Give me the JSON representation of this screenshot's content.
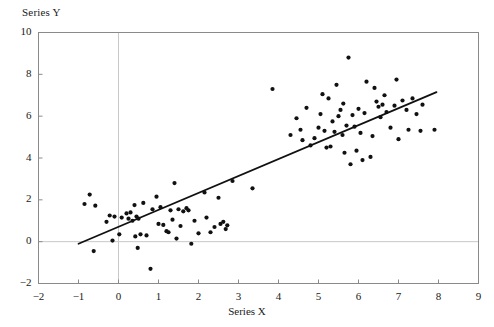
{
  "chart_data": {
    "type": "scatter",
    "title": "",
    "xlabel": "Series X",
    "ylabel": "Series Y",
    "xlim": [
      -2,
      9
    ],
    "ylim": [
      -2,
      10
    ],
    "xticks": [
      -2,
      -1,
      0,
      1,
      2,
      3,
      4,
      5,
      6,
      7,
      8,
      9
    ],
    "xticklabels": [
      "−2",
      "−1",
      "0",
      "1",
      "2",
      "3",
      "4",
      "5",
      "6",
      "7",
      "8",
      "9"
    ],
    "yticks": [
      -2,
      0,
      2,
      4,
      6,
      8,
      10
    ],
    "yticklabels": [
      "−2",
      "0",
      "2",
      "4",
      "6",
      "8",
      "10"
    ],
    "grid": false,
    "zero_gridlines": true,
    "legend": null,
    "marker_color": "#111111",
    "marker_size_px": 4.2,
    "frame_color": "#8a8a8a",
    "gridline_color": "#c8c8c8",
    "trendline": {
      "type": "linear",
      "color": "#111111",
      "width_px": 1.8,
      "slope": 0.81,
      "intercept": 0.71,
      "x_start": -1.0,
      "y_start": -0.1,
      "x_end": 7.95,
      "y_end": 7.15
    },
    "points": [
      [
        -0.85,
        1.8
      ],
      [
        -0.72,
        2.25
      ],
      [
        -0.62,
        -0.45
      ],
      [
        -0.58,
        1.72
      ],
      [
        -0.3,
        0.95
      ],
      [
        -0.22,
        1.25
      ],
      [
        -0.15,
        0.05
      ],
      [
        -0.1,
        1.2
      ],
      [
        0.02,
        0.35
      ],
      [
        0.08,
        1.15
      ],
      [
        0.2,
        1.35
      ],
      [
        0.25,
        1.1
      ],
      [
        0.3,
        1.4
      ],
      [
        0.35,
        1.0
      ],
      [
        0.4,
        1.75
      ],
      [
        0.42,
        0.25
      ],
      [
        0.45,
        1.2
      ],
      [
        0.48,
        -0.3
      ],
      [
        0.5,
        1.1
      ],
      [
        0.55,
        0.35
      ],
      [
        0.62,
        1.85
      ],
      [
        0.7,
        0.3
      ],
      [
        0.8,
        -1.3
      ],
      [
        0.85,
        1.55
      ],
      [
        0.95,
        2.15
      ],
      [
        1.0,
        0.85
      ],
      [
        1.05,
        1.65
      ],
      [
        1.12,
        0.8
      ],
      [
        1.2,
        0.5
      ],
      [
        1.25,
        0.45
      ],
      [
        1.3,
        1.5
      ],
      [
        1.35,
        1.05
      ],
      [
        1.4,
        2.8
      ],
      [
        1.45,
        0.15
      ],
      [
        1.5,
        1.55
      ],
      [
        1.55,
        0.75
      ],
      [
        1.62,
        1.45
      ],
      [
        1.7,
        1.6
      ],
      [
        1.75,
        1.5
      ],
      [
        1.82,
        -0.1
      ],
      [
        1.9,
        1.0
      ],
      [
        2.0,
        0.4
      ],
      [
        2.15,
        2.35
      ],
      [
        2.2,
        1.15
      ],
      [
        2.3,
        0.45
      ],
      [
        2.4,
        0.7
      ],
      [
        2.5,
        2.1
      ],
      [
        2.55,
        0.85
      ],
      [
        2.62,
        0.95
      ],
      [
        2.68,
        0.6
      ],
      [
        2.72,
        0.78
      ],
      [
        2.85,
        2.9
      ],
      [
        3.35,
        2.55
      ],
      [
        3.85,
        7.3
      ],
      [
        4.3,
        5.1
      ],
      [
        4.45,
        5.9
      ],
      [
        4.55,
        5.35
      ],
      [
        4.6,
        4.85
      ],
      [
        4.7,
        6.4
      ],
      [
        4.8,
        4.6
      ],
      [
        4.9,
        4.95
      ],
      [
        5.0,
        5.45
      ],
      [
        5.05,
        6.1
      ],
      [
        5.1,
        7.05
      ],
      [
        5.15,
        5.3
      ],
      [
        5.2,
        4.5
      ],
      [
        5.25,
        6.85
      ],
      [
        5.3,
        4.55
      ],
      [
        5.35,
        5.75
      ],
      [
        5.4,
        5.25
      ],
      [
        5.45,
        7.5
      ],
      [
        5.5,
        6.0
      ],
      [
        5.55,
        6.3
      ],
      [
        5.6,
        5.1
      ],
      [
        5.62,
        6.6
      ],
      [
        5.65,
        4.25
      ],
      [
        5.7,
        5.55
      ],
      [
        5.75,
        8.8
      ],
      [
        5.8,
        3.7
      ],
      [
        5.85,
        6.05
      ],
      [
        5.9,
        5.5
      ],
      [
        5.95,
        4.35
      ],
      [
        6.0,
        6.35
      ],
      [
        6.05,
        5.2
      ],
      [
        6.1,
        3.9
      ],
      [
        6.15,
        6.15
      ],
      [
        6.2,
        7.65
      ],
      [
        6.3,
        4.05
      ],
      [
        6.35,
        5.05
      ],
      [
        6.4,
        7.35
      ],
      [
        6.45,
        6.7
      ],
      [
        6.5,
        6.45
      ],
      [
        6.55,
        5.95
      ],
      [
        6.6,
        6.55
      ],
      [
        6.65,
        7.0
      ],
      [
        6.7,
        6.2
      ],
      [
        6.8,
        5.45
      ],
      [
        6.9,
        6.5
      ],
      [
        6.95,
        7.75
      ],
      [
        7.0,
        4.9
      ],
      [
        7.1,
        6.75
      ],
      [
        7.2,
        6.3
      ],
      [
        7.25,
        5.35
      ],
      [
        7.35,
        6.85
      ],
      [
        7.45,
        6.1
      ],
      [
        7.55,
        5.3
      ],
      [
        7.6,
        6.55
      ],
      [
        7.9,
        5.35
      ]
    ]
  },
  "axis": {
    "ylabel_text": "Series Y",
    "xlabel_text": "Series X"
  }
}
